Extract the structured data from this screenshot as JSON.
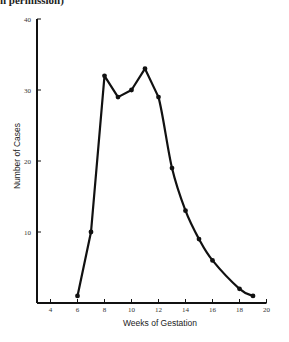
{
  "caption_fragment": "h permission)",
  "chart_data": {
    "type": "line",
    "title": "",
    "xlabel": "Weeks of Gestation",
    "ylabel": "Number of Cases",
    "x": [
      6,
      7,
      8,
      9,
      10,
      11,
      12,
      13,
      14,
      15,
      16,
      18,
      19
    ],
    "series": [
      {
        "name": "Number of Cases",
        "values": [
          1,
          10,
          32,
          29,
          30,
          33,
          29,
          19,
          13,
          9,
          6,
          2,
          1
        ]
      }
    ],
    "xlim": [
      3,
      20
    ],
    "ylim": [
      0,
      40
    ],
    "xticks": [
      "4",
      "6",
      "8",
      "10",
      "12",
      "14",
      "16",
      "18",
      "20"
    ],
    "yticks": [
      "10",
      "20",
      "30",
      "40"
    ],
    "grid": false,
    "legend": null
  },
  "colors": {
    "line": "#111111",
    "axis": "#111111"
  }
}
